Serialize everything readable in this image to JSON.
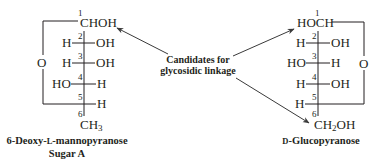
{
  "diagram": {
    "type": "fischer-projection-comparison",
    "left_sugar": {
      "name": "6-Deoxy-L-mannopyranose",
      "name_prefix": "6-Deoxy-",
      "name_config": "L",
      "name_suffix": "-mannopyranose",
      "subtitle": "Sugar A",
      "ring_oxygen": "O",
      "carbons": [
        {
          "number": "1",
          "left": "",
          "right": "",
          "center": "CHOH"
        },
        {
          "number": "2",
          "left": "H",
          "right": "OH"
        },
        {
          "number": "3",
          "left": "H",
          "right": "OH"
        },
        {
          "number": "4",
          "left": "HO",
          "right": "H"
        },
        {
          "number": "5",
          "left": "",
          "right": "H"
        },
        {
          "number": "6",
          "center": "CH",
          "subscript": "3"
        }
      ]
    },
    "right_sugar": {
      "name": "D-Glucopyranose",
      "name_config": "D",
      "name_suffix": "-Glucopyranose",
      "ring_oxygen": "O",
      "carbons": [
        {
          "number": "1",
          "center": "HOCH"
        },
        {
          "number": "2",
          "left": "H",
          "right": "OH"
        },
        {
          "number": "3",
          "left": "HO",
          "right": "H"
        },
        {
          "number": "4",
          "left": "H",
          "right": "OH"
        },
        {
          "number": "5",
          "left": "H",
          "right": ""
        },
        {
          "number": "6",
          "center_pre": "CH",
          "subscript": "2",
          "center_post": "OH"
        }
      ]
    },
    "annotation": {
      "line1": "Candidates for",
      "line2": "glycosidic linkage",
      "targets": [
        "left C1 CHOH",
        "right C1 HOCH",
        "right C6 CH2OH"
      ]
    },
    "colors": {
      "ink": "#231f20",
      "arrow": "#3a3a3a",
      "background": "#ffffff"
    }
  }
}
